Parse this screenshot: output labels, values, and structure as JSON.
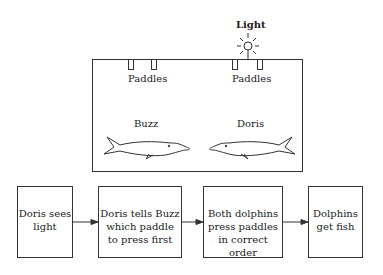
{
  "light_label": "Light",
  "pool": {
    "paddles_left_label": "Paddles",
    "paddles_right_label": "Paddles",
    "dolphin_left_name": "Buzz",
    "dolphin_right_name": "Doris"
  },
  "flow": [
    {
      "text": "Doris sees light"
    },
    {
      "text": "Doris tells Buzz which paddle to press first"
    },
    {
      "text": "Both dolphins press paddles in correct order"
    },
    {
      "text": "Dolphins get fish"
    }
  ],
  "flow_lines": [
    [
      "Doris sees",
      "light"
    ],
    [
      "Doris tells Buzz",
      "which paddle",
      "to press first"
    ],
    [
      "Both dolphins",
      "press paddles",
      "in correct order"
    ],
    [
      "Dolphins",
      "get fish"
    ]
  ]
}
